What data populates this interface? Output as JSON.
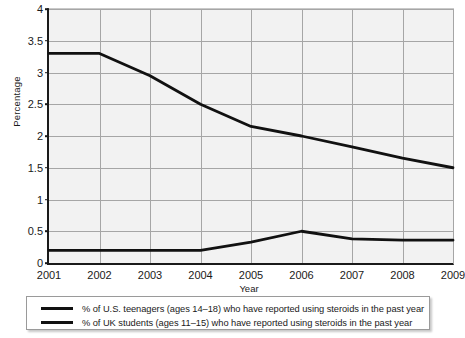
{
  "chart_data": {
    "type": "line",
    "title": "",
    "xlabel": "Year",
    "ylabel": "Percentage",
    "x": [
      2001,
      2002,
      2003,
      2004,
      2005,
      2006,
      2007,
      2008,
      2009
    ],
    "categories": [
      "2001",
      "2002",
      "2003",
      "2004",
      "2005",
      "2006",
      "2007",
      "2008",
      "2009"
    ],
    "xlim": [
      2001,
      2009
    ],
    "ylim": [
      0,
      4
    ],
    "ytick_labels": [
      "0",
      "0.5",
      "1",
      "1.5",
      "2",
      "2.5",
      "3",
      "3.5",
      "4"
    ],
    "ytick_values": [
      0,
      0.5,
      1,
      1.5,
      2,
      2.5,
      3,
      3.5,
      4
    ],
    "grid": true,
    "legend_position": "below-plot",
    "series": [
      {
        "name": "% of U.S. teenagers (ages 14–18) who have reported using steroids in the past year",
        "color": "#111111",
        "values": [
          3.3,
          3.3,
          2.95,
          2.5,
          2.15,
          2.0,
          1.83,
          1.65,
          1.5
        ]
      },
      {
        "name": "% of UK students (ages 11–15) who have reported using steroids in the past year",
        "color": "#111111",
        "values": [
          0.2,
          0.2,
          0.2,
          0.2,
          0.33,
          0.5,
          0.38,
          0.36,
          0.36
        ]
      }
    ]
  },
  "legend": {
    "items": [
      "% of U.S. teenagers (ages 14–18) who have reported using steroids in the past year",
      "% of UK students (ages 11–15) who have reported using steroids in the past year"
    ]
  },
  "axes": {
    "x_title": "Year",
    "y_title": "Percentage"
  }
}
